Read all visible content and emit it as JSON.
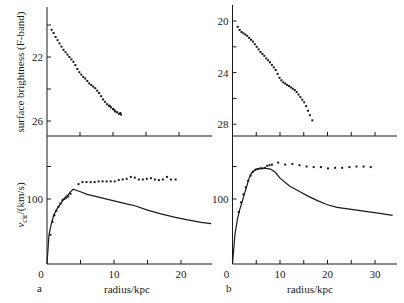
{
  "figure": {
    "panel_a_label": "a",
    "panel_b_label": "b",
    "ylabel_top": "surface brightness (F-band)",
    "ylabel_bottom_main": "v",
    "ylabel_bottom_sub": "cir",
    "ylabel_bottom_unit": "/(km/s)",
    "xlabel": "radius/kpc",
    "colors": {
      "ink": "#1a1a1a",
      "background": "#ffffff"
    }
  },
  "chart_data": [
    {
      "id": "a-top",
      "type": "scatter",
      "title": "",
      "xlabel": "",
      "ylabel": "surface brightness (F-band)",
      "y_inverted": true,
      "xlim": [
        0,
        25
      ],
      "ylim": [
        20,
        27
      ],
      "yticks": [
        20,
        22,
        24,
        26
      ],
      "ytick_labels": [
        "",
        "22",
        "",
        "26"
      ],
      "xticks": [
        5,
        10,
        15,
        20
      ],
      "series": [
        {
          "name": "F-band profile",
          "x": [
            0.7,
            1.0,
            1.3,
            1.6,
            1.9,
            2.2,
            2.5,
            2.8,
            3.1,
            3.4,
            3.7,
            4.0,
            4.3,
            4.6,
            4.9,
            5.2,
            5.5,
            5.8,
            6.1,
            6.4,
            6.7,
            7.0,
            7.3,
            7.6,
            7.9,
            8.2,
            8.5,
            8.8,
            9.1,
            9.4,
            9.7,
            10.0,
            10.3,
            10.6,
            10.9,
            11.2,
            11.1,
            9.5,
            10.2
          ],
          "y": [
            20.3,
            20.5,
            20.75,
            20.95,
            21.15,
            21.35,
            21.55,
            21.7,
            21.85,
            22.0,
            22.15,
            22.3,
            22.5,
            22.75,
            22.95,
            23.1,
            23.25,
            23.35,
            23.5,
            23.65,
            23.75,
            23.85,
            23.95,
            24.1,
            24.25,
            24.45,
            24.65,
            24.8,
            24.95,
            25.05,
            25.15,
            25.25,
            25.4,
            25.45,
            25.55,
            25.6,
            25.5,
            25.05,
            25.3
          ]
        }
      ]
    },
    {
      "id": "b-top",
      "type": "scatter",
      "title": "",
      "xlabel": "",
      "ylabel": "",
      "y_inverted": true,
      "xlim": [
        0,
        34
      ],
      "ylim": [
        19.5,
        29
      ],
      "yticks": [
        20,
        22,
        24,
        26,
        28
      ],
      "ytick_labels": [
        "20",
        "",
        "24",
        "",
        "28"
      ],
      "xticks": [
        5,
        10,
        15,
        20,
        25,
        30
      ],
      "series": [
        {
          "name": "F-band profile",
          "x": [
            1.1,
            1.5,
            1.9,
            2.3,
            2.7,
            3.1,
            3.5,
            3.9,
            4.3,
            4.7,
            5.1,
            5.5,
            5.9,
            6.3,
            6.7,
            7.1,
            7.5,
            7.9,
            8.3,
            8.7,
            9.1,
            9.5,
            9.9,
            10.3,
            10.7,
            11.1,
            11.5,
            11.9,
            12.3,
            12.7,
            13.1,
            13.5,
            13.9,
            14.3,
            14.7,
            15.1,
            15.5,
            15.9,
            16.3,
            16.8
          ],
          "y": [
            20.45,
            20.7,
            20.85,
            20.95,
            21.05,
            21.15,
            21.3,
            21.45,
            21.6,
            21.8,
            22.0,
            22.2,
            22.4,
            22.55,
            22.7,
            22.9,
            23.05,
            23.2,
            23.4,
            23.6,
            23.8,
            24.1,
            24.4,
            24.6,
            24.75,
            24.85,
            24.95,
            25.05,
            25.15,
            25.25,
            25.35,
            25.5,
            25.7,
            25.9,
            26.1,
            26.3,
            26.6,
            26.95,
            27.3,
            27.7
          ]
        }
      ]
    },
    {
      "id": "a-bottom",
      "type": "line",
      "title": "",
      "xlabel": "radius/kpc",
      "ylabel": "v_cir/(km/s)",
      "xlim": [
        0,
        25
      ],
      "ylim": [
        0,
        195
      ],
      "xticks": [
        0,
        5,
        10,
        15,
        20
      ],
      "xtick_labels": [
        "0",
        "",
        "10",
        "",
        "20"
      ],
      "yticks": [
        100,
        150
      ],
      "ytick_labels": [
        "100",
        ""
      ],
      "series": [
        {
          "name": "observed rotation curve",
          "style": "points",
          "x": [
            0.5,
            0.8,
            1.1,
            1.4,
            1.7,
            2.0,
            2.3,
            2.6,
            2.9,
            3.2,
            3.5,
            4.7,
            5.3,
            5.9,
            6.5,
            7.1,
            7.7,
            8.3,
            8.9,
            9.5,
            10.1,
            10.7,
            11.3,
            11.9,
            12.5,
            13.1,
            13.7,
            14.3,
            14.9,
            15.5,
            16.1,
            16.7,
            17.3,
            17.9,
            18.5,
            19.2
          ],
          "y": [
            45,
            65,
            75,
            82,
            88,
            93,
            98,
            100,
            102,
            104,
            108,
            123,
            126,
            126,
            126,
            126,
            127,
            127,
            127,
            127,
            127,
            129,
            130,
            131,
            134,
            133,
            130,
            130,
            131,
            132,
            130,
            129,
            130,
            134,
            130,
            130
          ]
        },
        {
          "name": "model curve",
          "style": "solid",
          "x": [
            0,
            0.3,
            0.6,
            1.0,
            1.5,
            2.0,
            2.5,
            3.0,
            3.5,
            3.9,
            5,
            6,
            8,
            10,
            12,
            13,
            15,
            17,
            19,
            21,
            23,
            24.5
          ],
          "y": [
            0,
            45,
            60,
            75,
            85,
            92,
            100,
            105,
            111,
            115,
            111,
            107,
            102,
            97,
            92,
            90,
            83,
            77,
            72,
            68,
            64,
            62
          ]
        }
      ]
    },
    {
      "id": "b-bottom",
      "type": "line",
      "title": "",
      "xlabel": "radius/kpc",
      "ylabel": "",
      "xlim": [
        0,
        34
      ],
      "ylim": [
        0,
        198
      ],
      "xticks": [
        0,
        5,
        10,
        15,
        20,
        25,
        30
      ],
      "xtick_labels": [
        "0",
        "",
        "10",
        "",
        "20",
        "",
        "30"
      ],
      "yticks": [
        100,
        150
      ],
      "ytick_labels": [
        "100",
        ""
      ],
      "series": [
        {
          "name": "observed rotation curve",
          "style": "points",
          "x": [
            1.3,
            1.8,
            2.3,
            2.8,
            3.3,
            3.8,
            4.3,
            4.8,
            5.3,
            5.8,
            6.3,
            6.8,
            7.3,
            7.8,
            8.3,
            9.6,
            11.1,
            12.6,
            14.1,
            15.6,
            17.1,
            18.6,
            20.1,
            21.6,
            23.1,
            24.6,
            26.1,
            27.6,
            29.1
          ],
          "y": [
            80,
            95,
            107,
            118,
            128,
            136,
            142,
            145,
            146,
            147,
            147,
            148,
            151,
            152,
            153,
            156,
            153,
            154,
            152,
            150,
            149,
            149,
            147,
            148,
            148,
            149,
            150,
            150,
            149
          ]
        },
        {
          "name": "model curve",
          "style": "solid",
          "x": [
            0,
            0.5,
            1.0,
            1.5,
            2,
            2.5,
            3,
            3.5,
            4,
            5,
            6,
            7,
            8,
            9,
            10,
            12,
            14,
            16,
            18,
            20,
            22,
            25,
            28,
            31,
            33.7
          ],
          "y": [
            0,
            45,
            68,
            83,
            95,
            108,
            120,
            132,
            140,
            146,
            147,
            147,
            146,
            141,
            132,
            120,
            112,
            104,
            97,
            91,
            87,
            84,
            81,
            78,
            75
          ]
        }
      ]
    }
  ]
}
